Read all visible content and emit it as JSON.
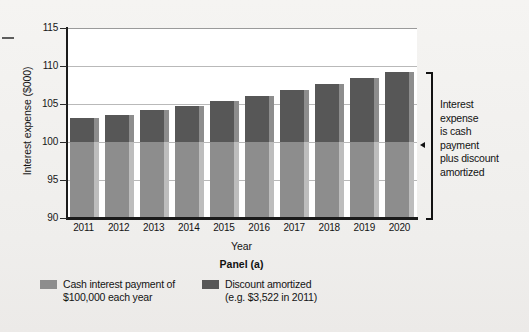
{
  "chart_data": {
    "type": "bar",
    "title": "",
    "subtitle": "",
    "panel_caption": "Panel (a)",
    "xlabel": "Year",
    "ylabel": "Interest expense ($000)",
    "ylim": [
      90,
      115
    ],
    "yticks": [
      90,
      95,
      100,
      105,
      110,
      115
    ],
    "grid": "horizontal",
    "stacked": true,
    "legend_position": "bottom",
    "categories": [
      "2011",
      "2012",
      "2013",
      "2014",
      "2015",
      "2016",
      "2017",
      "2018",
      "2019",
      "2020"
    ],
    "series": [
      {
        "name": "Cash interest payment of $100,000 each year",
        "color": "#8d8d8d",
        "values": [
          100.0,
          100.0,
          100.0,
          100.0,
          100.0,
          100.0,
          100.0,
          100.0,
          100.0,
          100.0
        ]
      },
      {
        "name": "Discount amortized (e.g. $3,522 in 2011)",
        "color": "#575757",
        "values": [
          3.1,
          3.5,
          4.2,
          4.7,
          5.4,
          6.1,
          6.9,
          7.6,
          8.4,
          9.2
        ]
      }
    ],
    "totals": [
      103.1,
      103.5,
      104.2,
      104.7,
      105.4,
      106.1,
      106.9,
      107.6,
      108.4,
      109.2
    ],
    "annotation": "Interest expense is cash payment plus discount amortized"
  },
  "axes": {
    "y_title": "Interest expense ($000)",
    "x_title": "Year",
    "y_tick_labels": [
      "115",
      "110",
      "105",
      "100",
      "95",
      "90"
    ],
    "x_tick_labels": [
      "2011",
      "2012",
      "2013",
      "2014",
      "2015",
      "2016",
      "2017",
      "2018",
      "2019",
      "2020"
    ]
  },
  "caption": {
    "panel": "Panel (a)"
  },
  "annotation": {
    "lines": [
      "Interest",
      "expense",
      "is cash",
      "payment",
      "plus discount",
      "amortized"
    ],
    "text": "Interest expense is cash payment plus discount amortized"
  },
  "legend": {
    "items": [
      {
        "line1": "Cash interest payment of",
        "line2": "$100,000 each year",
        "color": "#8d8d8d"
      },
      {
        "line1": "Discount amortized",
        "line2": "(e.g. $3,522 in 2011)",
        "color": "#575757"
      }
    ]
  },
  "colors": {
    "cash_segment": "#8d8d8d",
    "discount_segment": "#575757",
    "axis": "#1b1b1b",
    "gridline": "#b9b9b9",
    "plot_background": "#ffffff",
    "page_background": "#f2f1ef"
  }
}
